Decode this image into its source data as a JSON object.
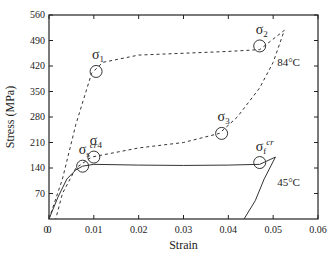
{
  "chart_data": {
    "type": "line",
    "title": "",
    "xlabel": "Strain",
    "ylabel": "Stress (MPa)",
    "xlim": [
      0,
      0.06
    ],
    "ylim": [
      0,
      560
    ],
    "xticks": [
      "0",
      "0.01",
      "0.02",
      "0.03",
      "0.04",
      "0.05",
      "0.06"
    ],
    "yticks": [
      "70",
      "140",
      "210",
      "280",
      "350",
      "420",
      "490",
      "560"
    ],
    "series": [
      {
        "name": "84°C",
        "style": "dashed",
        "x": [
          0,
          0.003,
          0.006,
          0.0095,
          0.012,
          0.02,
          0.03,
          0.04,
          0.047,
          0.0525,
          0.05,
          0.047,
          0.042,
          0.038,
          0.03,
          0.02,
          0.0095,
          0.006,
          0.003,
          0.0015
        ],
        "y": [
          0,
          110,
          260,
          400,
          430,
          450,
          455,
          460,
          465,
          518,
          430,
          360,
          280,
          235,
          210,
          195,
          170,
          140,
          70,
          0
        ]
      },
      {
        "name": "45°C",
        "style": "solid",
        "x": [
          0,
          0.002,
          0.004,
          0.006,
          0.0075,
          0.01,
          0.02,
          0.03,
          0.04,
          0.047,
          0.0505,
          0.048,
          0.046,
          0.0435
        ],
        "y": [
          0,
          60,
          110,
          135,
          145,
          150,
          148,
          147,
          148,
          150,
          170,
          110,
          50,
          0
        ]
      }
    ],
    "annotations": [
      {
        "label": "σ1",
        "x": 0.0105,
        "y": 405
      },
      {
        "label": "σ2",
        "x": 0.047,
        "y": 475
      },
      {
        "label": "σ3",
        "x": 0.0385,
        "y": 235
      },
      {
        "label": "σ4",
        "x": 0.01,
        "y": 170
      },
      {
        "label": "σs cr",
        "x": 0.0075,
        "y": 145
      },
      {
        "label": "σf cr",
        "x": 0.047,
        "y": 155
      },
      {
        "label": "84°C",
        "x": 0.05,
        "y": 420
      },
      {
        "label": "45°C",
        "x": 0.05,
        "y": 90
      }
    ]
  }
}
